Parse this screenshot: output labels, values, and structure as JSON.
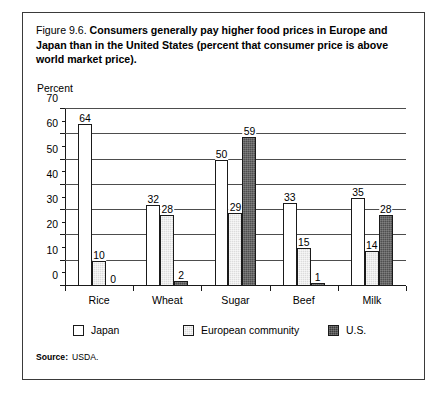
{
  "figure": {
    "number": "Figure 9.6.",
    "title": "Consumers generally pay higher food prices in Europe and Japan than in the United States (percent that consumer price is above world market price).",
    "source_label": "Source:",
    "source_value": "USDA."
  },
  "chart_data": {
    "type": "bar",
    "title": "Consumers generally pay higher food prices in Europe and Japan than in the United States (percent that consumer price is above world market price).",
    "xlabel": "",
    "ylabel": "Percent",
    "ylim": [
      0,
      70
    ],
    "ytick_labels": [
      "0",
      "10",
      "20",
      "30",
      "40",
      "50",
      "60",
      "70"
    ],
    "ytick_values": [
      0,
      10,
      20,
      30,
      40,
      50,
      60,
      70
    ],
    "minor_tick_step": 5,
    "grid": true,
    "legend_position": "bottom",
    "categories": [
      "Rice",
      "Wheat",
      "Sugar",
      "Beef",
      "Milk"
    ],
    "series": [
      {
        "name": "Japan",
        "color": "#ffffff",
        "values": [
          64,
          32,
          50,
          33,
          35
        ]
      },
      {
        "name": "European community",
        "color": "#dcdcdc",
        "values": [
          10,
          28,
          29,
          15,
          14
        ]
      },
      {
        "name": "U.S.",
        "color": "#4f4f4f",
        "values": [
          0,
          2,
          59,
          1,
          28
        ]
      }
    ]
  }
}
